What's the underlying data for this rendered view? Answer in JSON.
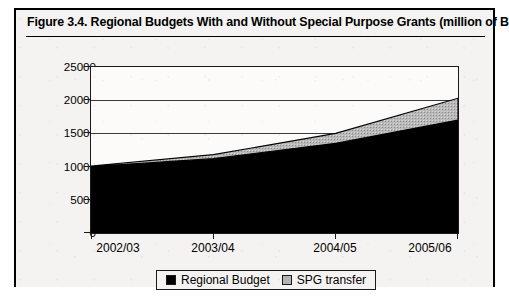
{
  "figure": {
    "caption": "Figure 3.4.  Regional Budgets With and Without Special Purpose Grants (million of Birr)"
  },
  "legend": {
    "entries": [
      {
        "label": "Regional Budget",
        "color": "#000000",
        "swatch": "solid-black-swatch"
      },
      {
        "label": "SPG transfer",
        "color": "#b3b3b3",
        "swatch": "hatched-grey-swatch"
      }
    ]
  },
  "axes": {
    "y_ticks": [
      "25000",
      "20000",
      "15000",
      "10000",
      "5000",
      "0"
    ],
    "x_ticks": [
      "2002/03",
      "2003/04",
      "2004/05",
      "2005/06"
    ]
  },
  "chart_data": {
    "type": "area",
    "stacked": true,
    "title": "Figure 3.4.  Regional Budgets With and Without Special Purpose Grants (million of Birr)",
    "xlabel": "",
    "ylabel": "",
    "units": "million of Birr",
    "categories": [
      "2002/03",
      "2003/04",
      "2004/05",
      "2005/06"
    ],
    "series": [
      {
        "name": "Regional Budget",
        "color": "#000000",
        "values": [
          10000,
          11200,
          13500,
          17000
        ]
      },
      {
        "name": "SPG transfer",
        "color": "#b3b3b3",
        "values": [
          100,
          600,
          1500,
          3300
        ]
      }
    ],
    "totals": [
      10100,
      11800,
      15000,
      20300
    ],
    "ylim": [
      0,
      25000
    ],
    "ytick_step": 5000,
    "grid": true,
    "legend_position": "bottom-center"
  }
}
